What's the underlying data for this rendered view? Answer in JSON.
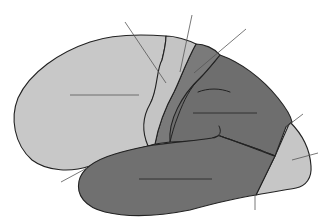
{
  "diagram": {
    "type": "brain-lateral-view-unlabeled",
    "colors": {
      "background": "#ffffff",
      "light_region": "#c8c8c8",
      "precentral_strip": "#c4c4c4",
      "postcentral_strip": "#7a7a7a",
      "dark_region": "#6e6e6e",
      "temporal_region": "#707070",
      "occipital_region": "#c6c6c6",
      "outline": "#222222",
      "leader": "#555555"
    },
    "regions": [
      {
        "id": "frontal-lobe",
        "shade": "light"
      },
      {
        "id": "precentral-gyrus",
        "shade": "light"
      },
      {
        "id": "postcentral-gyrus",
        "shade": "dark"
      },
      {
        "id": "parietal-lobe",
        "shade": "dark"
      },
      {
        "id": "temporal-lobe",
        "shade": "dark"
      },
      {
        "id": "occipital-lobe",
        "shade": "light"
      }
    ],
    "leader_lines": [
      {
        "id": "leader-precentral-sulcus-region",
        "x1": 125,
        "y1": 22,
        "x2": 166,
        "y2": 83
      },
      {
        "id": "leader-central-sulcus",
        "x1": 192,
        "y1": 15,
        "x2": 180,
        "y2": 72
      },
      {
        "id": "leader-postcentral",
        "x1": 246,
        "y1": 29,
        "x2": 194,
        "y2": 73
      },
      {
        "id": "leader-frontal-center",
        "x1": 70,
        "y1": 95,
        "x2": 139,
        "y2": 95
      },
      {
        "id": "leader-parietal-center",
        "x1": 193,
        "y1": 113,
        "x2": 257,
        "y2": 113
      },
      {
        "id": "leader-parieto-occipital",
        "x1": 303,
        "y1": 114,
        "x2": 286,
        "y2": 127
      },
      {
        "id": "leader-occipital",
        "x1": 318,
        "y1": 153,
        "x2": 292,
        "y2": 160
      },
      {
        "id": "leader-temporal-center",
        "x1": 139,
        "y1": 179,
        "x2": 212,
        "y2": 179
      },
      {
        "id": "leader-lateral-sulcus",
        "x1": 61,
        "y1": 182,
        "x2": 87,
        "y2": 168
      },
      {
        "id": "leader-preoccipital-notch",
        "x1": 255,
        "y1": 195,
        "x2": 255,
        "y2": 210
      }
    ]
  }
}
